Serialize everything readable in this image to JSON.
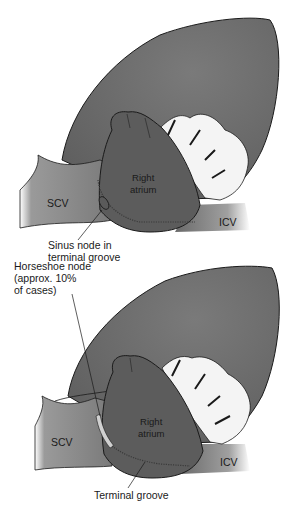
{
  "figure": {
    "top_panel": {
      "labels": {
        "right_atrium_line1": "Right",
        "right_atrium_line2": "atrium",
        "scv": "SCV",
        "icv": "ICV",
        "sinus_node_line1": "Sinus node in",
        "sinus_node_line2": "terminal groove"
      }
    },
    "bottom_panel": {
      "labels": {
        "horseshoe_line1": "Horseshoe node",
        "horseshoe_line2": "(approx. 10%",
        "horseshoe_line3": "of cases)",
        "right_atrium_line1": "Right",
        "right_atrium_line2": "atrium",
        "scv": "SCV",
        "icv": "ICV",
        "terminal_groove": "Terminal groove"
      }
    },
    "colors": {
      "heart": "#6b6b6b",
      "atrium": "#5a5a5a",
      "vessel": "#8a8a8a",
      "fat": "#f2f2f2",
      "outline": "#1a1a1a"
    }
  }
}
